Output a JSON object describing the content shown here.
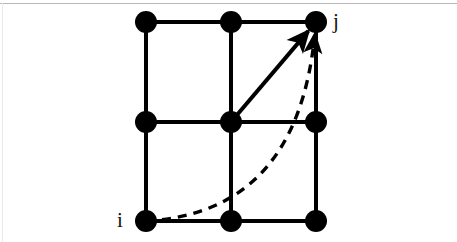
{
  "figure": {
    "background_color": "#ffffff",
    "border_color": "#b8b8b8",
    "stroke_color": "#000000",
    "node_color": "#000000",
    "width": 457,
    "height": 242
  },
  "labels": {
    "source": "i",
    "target": "j"
  },
  "chart_data": {
    "type": "diagram",
    "node_radius": 11,
    "edge_width": 4,
    "grid": {
      "columns_x": [
        146,
        231,
        316
      ],
      "rows_y": [
        22,
        122,
        221
      ],
      "rows": 3,
      "columns": 3
    },
    "nodes": [
      {
        "id": "n00",
        "x": 146,
        "y": 22,
        "label": ""
      },
      {
        "id": "n10",
        "x": 231,
        "y": 22,
        "label": ""
      },
      {
        "id": "n20",
        "x": 316,
        "y": 22,
        "label": "j"
      },
      {
        "id": "n01",
        "x": 146,
        "y": 122,
        "label": ""
      },
      {
        "id": "n11",
        "x": 231,
        "y": 122,
        "label": ""
      },
      {
        "id": "n21",
        "x": 316,
        "y": 122,
        "label": ""
      },
      {
        "id": "n02",
        "x": 146,
        "y": 221,
        "label": "i"
      },
      {
        "id": "n12",
        "x": 231,
        "y": 221,
        "label": ""
      },
      {
        "id": "n22",
        "x": 316,
        "y": 221,
        "label": ""
      }
    ],
    "lattice_edges": [
      {
        "from": "n00",
        "to": "n10"
      },
      {
        "from": "n10",
        "to": "n20"
      },
      {
        "from": "n01",
        "to": "n11"
      },
      {
        "from": "n11",
        "to": "n21"
      },
      {
        "from": "n02",
        "to": "n12"
      },
      {
        "from": "n12",
        "to": "n22"
      },
      {
        "from": "n00",
        "to": "n01"
      },
      {
        "from": "n01",
        "to": "n02"
      },
      {
        "from": "n10",
        "to": "n11"
      },
      {
        "from": "n11",
        "to": "n12"
      },
      {
        "from": "n20",
        "to": "n21"
      },
      {
        "from": "n21",
        "to": "n22"
      }
    ],
    "arrows": [
      {
        "name": "direct-diagonal-arrow",
        "style": "solid",
        "from": "n11",
        "to": "n20",
        "from_xy": [
          231,
          122
        ],
        "to_xy": [
          316,
          22
        ],
        "arrowhead": true
      },
      {
        "name": "curved-dashed-path",
        "style": "dashed",
        "from": "n02",
        "to": "n20",
        "from_xy": [
          146,
          221
        ],
        "to_xy": [
          316,
          22
        ],
        "control_xy": [
          297,
          213
        ],
        "dash_pattern": "9 7",
        "arrowhead": true
      }
    ],
    "annotations": [
      {
        "text": "i",
        "x": 122,
        "y": 222,
        "anchor": "right-of-node"
      },
      {
        "text": "j",
        "x": 338,
        "y": 22,
        "anchor": "left-of-node"
      }
    ]
  }
}
